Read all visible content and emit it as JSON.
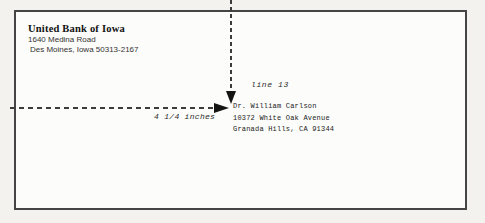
{
  "envelope": {
    "return_address": {
      "name": "United Bank of Iowa",
      "street": "1640 Medina Road",
      "city": "Des Moines, Iowa 50313-2167"
    },
    "recipient": {
      "line1": "Dr. William Carlson",
      "line2": "10372 White Oak Avenue",
      "line3": "Granada Hills, CA 91344"
    }
  },
  "annotations": {
    "vertical_guide_label": "line 13",
    "horizontal_guide_label": "4 1/4 inches"
  },
  "colors": {
    "page_background": "#f3f2ee",
    "envelope_background": "#fcfcfa",
    "envelope_border": "#454545",
    "dash_line": "#3c3c3c",
    "arrow": "#141414",
    "text": "#222222"
  }
}
